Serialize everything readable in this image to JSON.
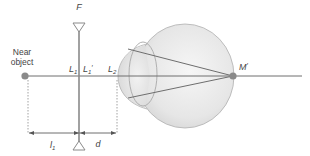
{
  "figure": {
    "type": "optics-diagram",
    "labels": {
      "focal": "F",
      "near_object_line1": "Near",
      "near_object_line2": "object",
      "lens1_front": "L",
      "lens1_front_sub": "1",
      "lens1_back": "L",
      "lens1_back_sub": "1",
      "lens1_back_prime": "′",
      "lens2": "L",
      "lens2_sub": "2",
      "image_point": "M",
      "image_point_prime": "′",
      "distance_l1": "l",
      "distance_l1_sub": "1",
      "distance_d": "d"
    },
    "colors": {
      "line": "#6e6e6e",
      "dot": "#8a8a8a",
      "eye_fill_light": "#f4f4f4",
      "eye_fill_dark": "#d9d9d9",
      "eye_stroke": "#a8a8a8",
      "text": "#444444"
    }
  }
}
